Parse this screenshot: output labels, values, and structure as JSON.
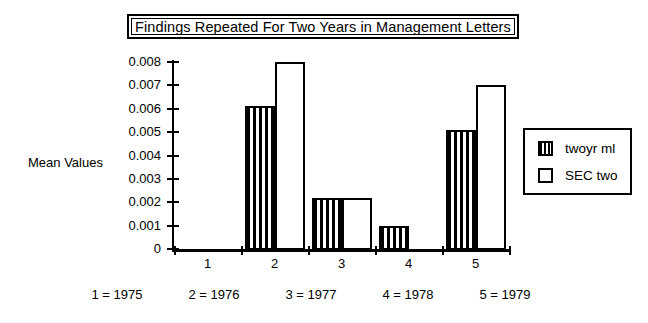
{
  "chart_data": {
    "type": "bar",
    "title": "Findings Repeated For Two Years in Management Letters",
    "xlabel": "",
    "ylabel": "Mean Values",
    "categories": [
      "1",
      "2",
      "3",
      "4",
      "5"
    ],
    "series": [
      {
        "name": "twoyr ml",
        "pattern": "vertical-hatch",
        "values": [
          0,
          0.0061,
          0.0022,
          0.001,
          0.0051
        ]
      },
      {
        "name": "SEC two",
        "pattern": "solid-white",
        "values": [
          0,
          0.008,
          0.0022,
          0,
          0.007
        ]
      }
    ],
    "ylim": [
      0,
      0.008
    ],
    "yticks": [
      "0",
      "0.001",
      "0.002",
      "0.003",
      "0.004",
      "0.005",
      "0.006",
      "0.007",
      "0.008"
    ],
    "ytick_values": [
      0,
      0.001,
      0.002,
      0.003,
      0.004,
      0.005,
      0.006,
      0.007,
      0.008
    ],
    "grid": false,
    "legend_position": "right"
  },
  "title": {
    "text": "Findings Repeated For Two Years in Management Letters"
  },
  "axes": {
    "y_title": "Mean Values",
    "y_labels": [
      "0.008",
      "0.007",
      "0.006",
      "0.005",
      "0.004",
      "0.003",
      "0.002",
      "0.001",
      "0"
    ],
    "x_labels": [
      "1",
      "2",
      "3",
      "4",
      "5"
    ]
  },
  "legend": {
    "items": [
      {
        "label": "twoyr ml",
        "swatch": "hatched-swatch"
      },
      {
        "label": "SEC two",
        "swatch": "white-swatch"
      }
    ]
  },
  "footer": {
    "items": [
      "1 = 1975",
      "2 = 1976",
      "3 = 1977",
      "4 = 1978",
      "5 = 1979"
    ]
  }
}
